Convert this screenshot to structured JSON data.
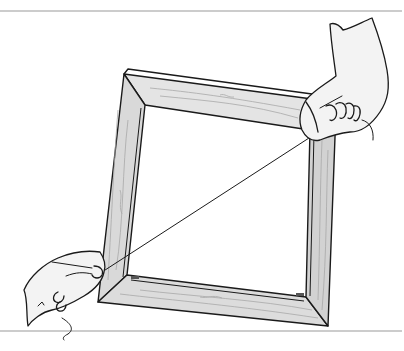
{
  "illustration": {
    "subject": "Hands stretching a string diagonally across a square wooden frame to check it is square",
    "style": "black ink line drawing with grey wood-grain shading",
    "colors": {
      "background": "#ffffff",
      "ink": "#1a1a1a",
      "wood_light": "#e2e2e2",
      "wood_mid": "#cfcfcf",
      "wood_dark": "#b8b8b8",
      "skin": "#f3f3f3",
      "rule_line": "#9a9a9a"
    },
    "elements": [
      {
        "name": "top-rule-line"
      },
      {
        "name": "wooden-frame"
      },
      {
        "name": "diagonal-string"
      },
      {
        "name": "right-hand"
      },
      {
        "name": "left-hand"
      },
      {
        "name": "bottom-rule-line"
      }
    ]
  }
}
